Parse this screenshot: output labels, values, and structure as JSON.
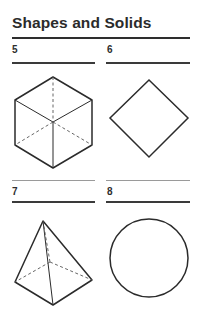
{
  "page": {
    "title": "Shapes and Solids"
  },
  "items": [
    {
      "number": "5",
      "shape": "cube"
    },
    {
      "number": "6",
      "shape": "square"
    },
    {
      "number": "7",
      "shape": "square-pyramid"
    },
    {
      "number": "8",
      "shape": "circle"
    }
  ]
}
